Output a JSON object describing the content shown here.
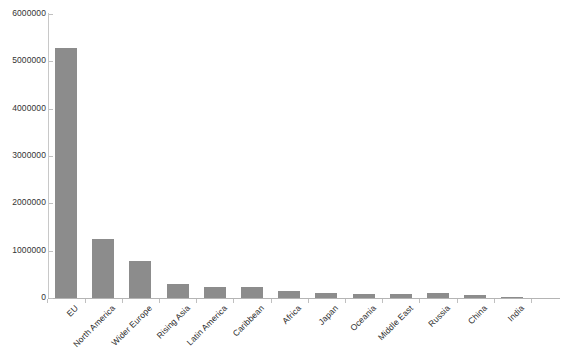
{
  "chart_data": {
    "type": "bar",
    "title": "",
    "subtitle": "",
    "xlabel": "",
    "ylabel": "",
    "legend": [],
    "legend_position": "none",
    "grid": false,
    "ylim": [
      0,
      6000000
    ],
    "ytick_step": 1000000,
    "ytick_labels": [
      "6000000",
      "5000000",
      "4000000",
      "3000000",
      "2000000",
      "1000000",
      "0"
    ],
    "ytick_values": [
      6000000,
      5000000,
      4000000,
      3000000,
      2000000,
      1000000,
      0
    ],
    "bar_color": "#8c8c8c",
    "axis_color": "#c0c0c0",
    "categories": [
      "EU",
      "North America",
      "Wider Europe",
      "Rising Asia",
      "Latin America",
      "Caribbean",
      "Africa",
      "Japan",
      "Oceania",
      "Middle East",
      "Russia",
      "China",
      "India"
    ],
    "values": [
      5280000,
      1250000,
      780000,
      290000,
      240000,
      240000,
      140000,
      100000,
      95000,
      90000,
      115000,
      60000,
      30000
    ]
  }
}
